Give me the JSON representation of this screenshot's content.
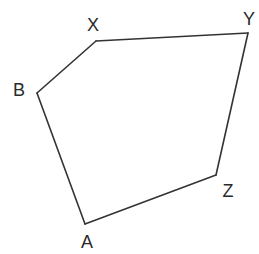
{
  "colors": {
    "line": "#333333",
    "label": "#2a2a2a",
    "background": "#ffffff"
  },
  "vertices": [
    {
      "id": "A",
      "label": "A",
      "x": 85,
      "y": 224,
      "label_x": 87,
      "label_y": 248
    },
    {
      "id": "B",
      "label": "B",
      "x": 37,
      "y": 93,
      "label_x": 19,
      "label_y": 96
    },
    {
      "id": "X",
      "label": "X",
      "x": 96,
      "y": 41,
      "label_x": 93,
      "label_y": 31
    },
    {
      "id": "Y",
      "label": "Y",
      "x": 248,
      "y": 33,
      "label_x": 249,
      "label_y": 25
    },
    {
      "id": "Z",
      "label": "Z",
      "x": 216,
      "y": 175,
      "label_x": 228,
      "label_y": 197
    }
  ],
  "edges": [
    [
      "A",
      "B"
    ],
    [
      "B",
      "X"
    ],
    [
      "X",
      "Y"
    ],
    [
      "Y",
      "Z"
    ],
    [
      "Z",
      "A"
    ]
  ]
}
